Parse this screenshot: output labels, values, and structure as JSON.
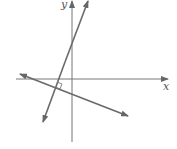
{
  "diagram": {
    "axes": {
      "x_label": "x",
      "y_label": "y"
    },
    "lines": [
      {
        "name": "steep-line",
        "from": [
          43,
          122
        ],
        "to": [
          88,
          0
        ]
      },
      {
        "name": "shallow-line",
        "from": [
          20,
          74
        ],
        "to": [
          128,
          116
        ]
      }
    ],
    "right_angle_marker": true,
    "colors": {
      "axis": "#777777",
      "line": "#6a6a6a",
      "background": "#ffffff"
    }
  }
}
